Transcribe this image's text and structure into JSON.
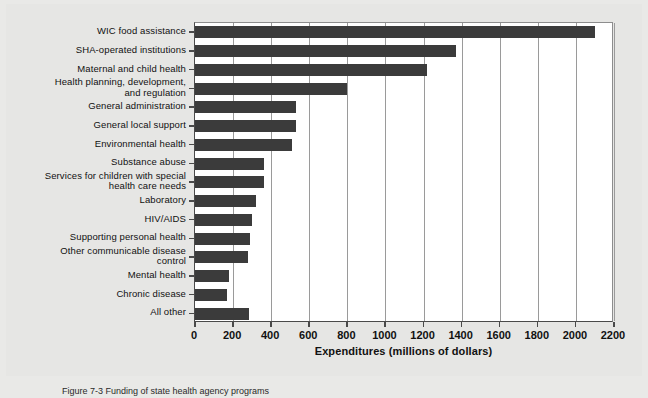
{
  "figure": {
    "caption": "Figure 7-3   Funding of state health agency programs",
    "background_color": "#e9e9e7",
    "plot_background_color": "#ffffff",
    "bar_color": "#3b3b3b"
  },
  "chart_data": {
    "type": "bar",
    "orientation": "horizontal",
    "title": "",
    "xlabel": "Expenditures (millions of dollars)",
    "ylabel": "",
    "xlim": [
      0,
      2200
    ],
    "xticks": [
      0,
      200,
      400,
      600,
      800,
      1000,
      1200,
      1400,
      1600,
      1800,
      2000,
      2200
    ],
    "xtick_labels": [
      "0",
      "200",
      "400",
      "600",
      "800",
      "1000",
      "1200",
      "1400",
      "1600",
      "1800",
      "2000",
      "2200"
    ],
    "grid": "vertical",
    "legend": "none",
    "categories": [
      "WIC food assistance",
      "SHA-operated institutions",
      "Maternal and child health",
      "Health planning, development,\nand regulation",
      "General administration",
      "General local support",
      "Environmental health",
      "Substance abuse",
      "Services for children with special\nhealth care needs",
      "Laboratory",
      "HIV/AIDS",
      "Supporting personal health",
      "Other communicable disease\ncontrol",
      "Mental health",
      "Chronic disease",
      "All other"
    ],
    "values": [
      2100,
      1370,
      1220,
      800,
      530,
      530,
      510,
      360,
      360,
      320,
      300,
      290,
      280,
      180,
      170,
      285
    ]
  }
}
